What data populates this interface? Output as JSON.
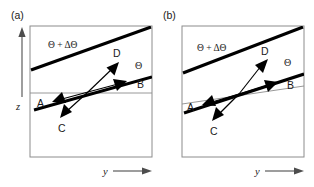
{
  "figure": {
    "caption_present": false,
    "panels": [
      {
        "id": "a",
        "label": "(a)",
        "axes": {
          "y_axis_label": "z",
          "x_axis_label": "y"
        },
        "isentropes": [
          {
            "name": "upper-isentrope",
            "label": "Θ + ΔΘ"
          },
          {
            "name": "lower-isentrope",
            "label": "Θ"
          }
        ],
        "reference_line": {
          "name": "horizontal-reference-line",
          "tilted": false
        },
        "vectors": [
          {
            "id": "A",
            "label": "A",
            "direction": "left-slightly-down"
          },
          {
            "id": "B",
            "label": "B",
            "direction": "right-slightly-up"
          },
          {
            "id": "C",
            "label": "C",
            "direction": "left-down-steep"
          },
          {
            "id": "D",
            "label": "D",
            "direction": "right-up-steep"
          }
        ]
      },
      {
        "id": "b",
        "label": "(b)",
        "axes": {
          "y_axis_label": "z",
          "x_axis_label": "y"
        },
        "isentropes": [
          {
            "name": "upper-isentrope",
            "label": "Θ + ΔΘ"
          },
          {
            "name": "lower-isentrope",
            "label": "Θ"
          }
        ],
        "reference_line": {
          "name": "tilted-reference-line",
          "tilted": true
        },
        "vectors": [
          {
            "id": "A",
            "label": "A",
            "direction": "left-slightly-down"
          },
          {
            "id": "B",
            "label": "B",
            "direction": "right-slightly-up"
          },
          {
            "id": "C",
            "label": "C",
            "direction": "left-down-steep"
          },
          {
            "id": "D",
            "label": "D",
            "direction": "right-up-steep"
          }
        ]
      }
    ],
    "colors": {
      "ink": "#000000",
      "frame": "#8c8c8c",
      "background": "#ffffff"
    }
  }
}
